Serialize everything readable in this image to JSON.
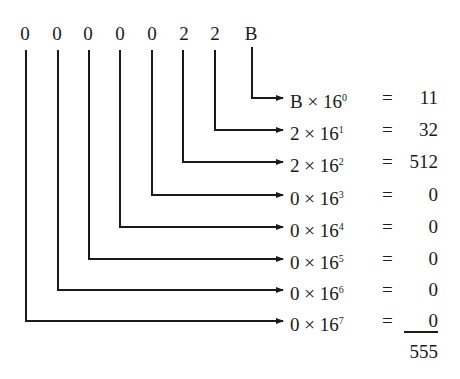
{
  "hex_digits": [
    "0",
    "0",
    "0",
    "0",
    "0",
    "2",
    "2",
    "B"
  ],
  "rows": [
    {
      "digit": "B",
      "base": "16",
      "power": "0",
      "equals": "=",
      "value": "11"
    },
    {
      "digit": "2",
      "base": "16",
      "power": "1",
      "equals": "=",
      "value": "32"
    },
    {
      "digit": "2",
      "base": "16",
      "power": "2",
      "equals": "=",
      "value": "512"
    },
    {
      "digit": "0",
      "base": "16",
      "power": "3",
      "equals": "=",
      "value": "0"
    },
    {
      "digit": "0",
      "base": "16",
      "power": "4",
      "equals": "=",
      "value": "0"
    },
    {
      "digit": "0",
      "base": "16",
      "power": "5",
      "equals": "=",
      "value": "0"
    },
    {
      "digit": "0",
      "base": "16",
      "power": "6",
      "equals": "=",
      "value": "0"
    },
    {
      "digit": "0",
      "base": "16",
      "power": "7",
      "equals": "=",
      "value": "0"
    }
  ],
  "times_symbol": "×",
  "total": "555",
  "colors": {
    "ink": "#1a1a1a",
    "background": "#ffffff"
  }
}
